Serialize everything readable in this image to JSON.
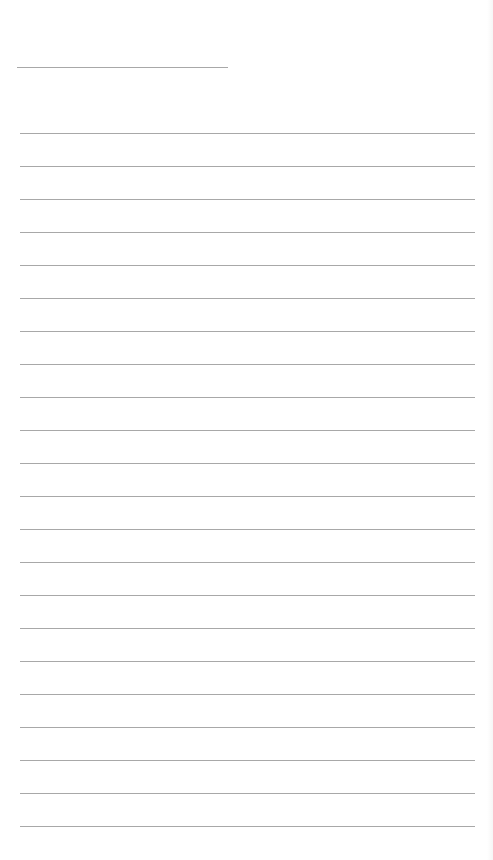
{
  "page": {
    "type": "lined-paper",
    "background_color": "#ffffff",
    "line_color": "#a8a8a8",
    "title_line": {
      "y": 67,
      "x_start": 17,
      "x_end": 228
    },
    "ruled_lines": {
      "count": 22,
      "first_y": 133,
      "spacing": 33,
      "x_start": 20,
      "x_end": 475
    },
    "text_content": []
  }
}
